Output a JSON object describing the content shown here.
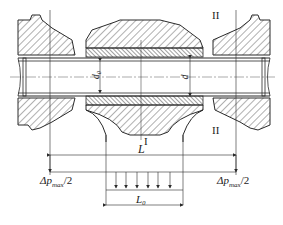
{
  "diagram": {
    "type": "engineering-cross-section",
    "colors": {
      "line": "#2a2a2a",
      "hatch": "#3a3a3a",
      "background": "#ffffff"
    },
    "labels": {
      "zone_I_top": "I",
      "zone_II_top": "II",
      "zone_II_bottom": "II",
      "zone_I_bottom": "I",
      "inner_diameter": "d₀",
      "outer_diameter": "d",
      "length_L": "L",
      "length_L0": "L₀",
      "pressure_left": "Δp",
      "pressure_left_sub": "max",
      "pressure_left_tail": "/2",
      "pressure_right": "Δp",
      "pressure_right_sub": "max",
      "pressure_right_tail": "/2"
    },
    "load_arrows_count": 6
  }
}
